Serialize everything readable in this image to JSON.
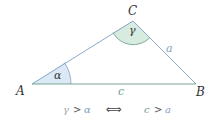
{
  "figure": {
    "vertices": {
      "A": {
        "label": "A",
        "x": 32,
        "y": 84
      },
      "B": {
        "label": "B",
        "x": 196,
        "y": 84
      },
      "C": {
        "label": "C",
        "x": 133,
        "y": 21
      }
    },
    "sides": {
      "a": {
        "label": "a",
        "color": "#7f9fc0"
      },
      "c": {
        "label": "c",
        "color": "#6a9e88"
      },
      "b": {
        "color": "#7f9fc0"
      }
    },
    "angles": {
      "alpha": {
        "label": "α",
        "fill": "#dbe9f7",
        "stroke": "#7f9fc0"
      },
      "gamma": {
        "label": "γ",
        "fill": "#d8ebe1",
        "stroke": "#6a9e88"
      }
    },
    "relation": {
      "left_greek": "γ",
      "gt1": ">",
      "left_rhs": "α",
      "iff": "⟺",
      "right_lhs": "c",
      "gt2": ">",
      "right_rhs": "a"
    },
    "colors": {
      "green": "#6a9e88",
      "blue": "#7f9fc0",
      "text": "#333333",
      "greek_gray": "#9aa6a0"
    }
  }
}
